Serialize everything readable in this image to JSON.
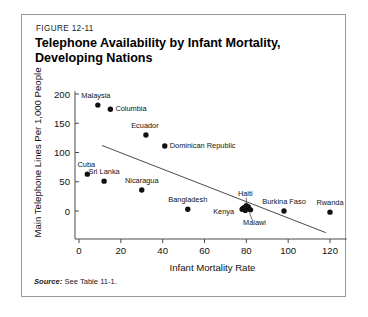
{
  "figure": {
    "number": "FIGURE 12-11",
    "title_line1": "Telephone Availability by Infant Mortality,",
    "title_line2": "Developing Nations",
    "source_lead": "Source:",
    "source_text": " See Table 11-1."
  },
  "chart_data": {
    "type": "scatter",
    "title": "Telephone Availability by Infant Mortality, Developing Nations",
    "xlabel": "Infant Mortality Rate",
    "ylabel": "Main Telephone Lines Per 1,000 People",
    "xlim": [
      0,
      130
    ],
    "ylim": [
      -15,
      205
    ],
    "xticks": [
      "0",
      "20",
      "40",
      "60",
      "80",
      "100",
      "120"
    ],
    "xtick_values": [
      0,
      20,
      40,
      60,
      80,
      100,
      120
    ],
    "yticks": [
      "0",
      "50",
      "100",
      "150",
      "200"
    ],
    "ytick_values": [
      0,
      50,
      100,
      150,
      200
    ],
    "grid": false,
    "legend": "none",
    "points": [
      {
        "label": "Malaysia",
        "x": 9,
        "y": 181,
        "label_dx": -2,
        "label_dy": -7,
        "anchor": "middle"
      },
      {
        "label": "Columbia",
        "x": 15,
        "y": 174,
        "label_dx": 5,
        "label_dy": 2,
        "anchor": "start"
      },
      {
        "label": "Ecuador",
        "x": 32,
        "y": 130,
        "label_dx": -1,
        "label_dy": -7,
        "anchor": "middle"
      },
      {
        "label": "Dominican Republic",
        "x": 41,
        "y": 111,
        "label_dx": 5,
        "label_dy": 2,
        "anchor": "start"
      },
      {
        "label": "Cuba",
        "x": 4,
        "y": 63,
        "label_dx": -1,
        "label_dy": -7,
        "anchor": "middle"
      },
      {
        "label": "Sri Lanka",
        "x": 12,
        "y": 51,
        "label_dx": 0,
        "label_dy": -7,
        "anchor": "middle"
      },
      {
        "label": "Nicaragua",
        "x": 30,
        "y": 36,
        "label_dx": 0,
        "label_dy": -7,
        "anchor": "middle"
      },
      {
        "label": "Bangladesh",
        "x": 52,
        "y": 3,
        "label_dx": 0,
        "label_dy": -7,
        "anchor": "middle"
      },
      {
        "label": "Haiti",
        "x": 80,
        "y": 9,
        "label_dx": -1,
        "label_dy": -10,
        "anchor": "middle"
      },
      {
        "label": "Kenya",
        "x": 78,
        "y": 3,
        "label_dx": -8,
        "label_dy": 5,
        "anchor": "end"
      },
      {
        "label": "Malawi",
        "x": 82,
        "y": 2,
        "label_dx": 4,
        "label_dy": 15,
        "anchor": "middle"
      },
      {
        "label": "Burkina Faso",
        "x": 98,
        "y": 0,
        "label_dx": 0,
        "label_dy": -7,
        "anchor": "middle"
      },
      {
        "label": "Rwanda",
        "x": 120,
        "y": -2,
        "label_dx": 0,
        "label_dy": -7,
        "anchor": "middle"
      }
    ],
    "cluster_extra": [
      {
        "x": 79,
        "y": 6
      },
      {
        "x": 80.5,
        "y": 4
      },
      {
        "x": 81,
        "y": 7
      },
      {
        "x": 79.5,
        "y": 1
      },
      {
        "x": 81.5,
        "y": 3
      },
      {
        "x": 78.5,
        "y": 5
      }
    ],
    "trend_line": {
      "x1": 11,
      "y1": 112,
      "x2": 118,
      "y2": -37
    }
  }
}
